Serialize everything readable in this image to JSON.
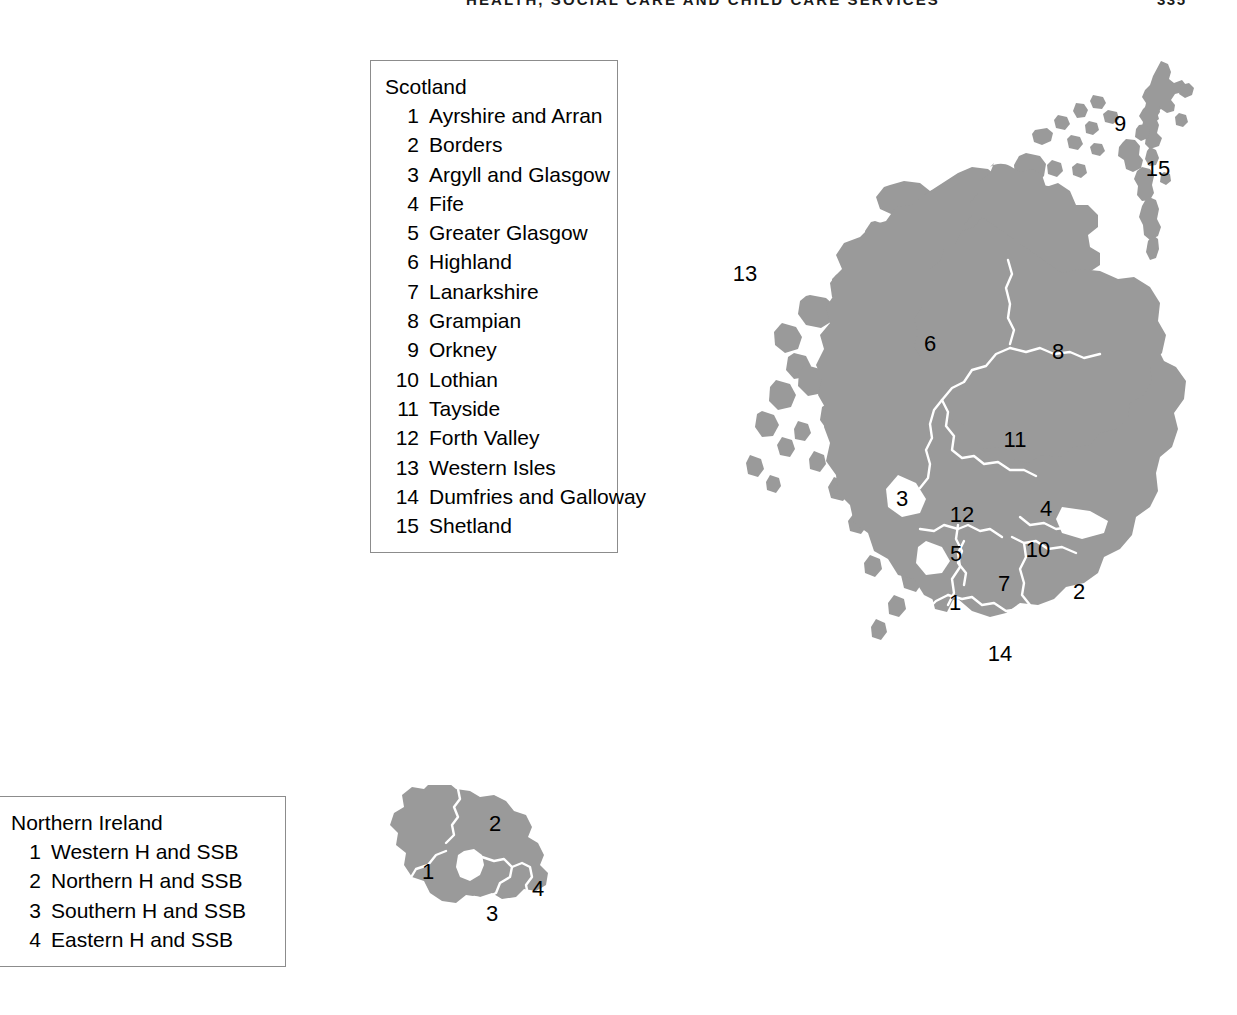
{
  "header": {
    "title": "HEALTH, SOCIAL CARE AND CHILD CARE SERVICES",
    "page_number": "335"
  },
  "legends": {
    "scotland": {
      "title": "Scotland",
      "items": [
        {
          "num": "1",
          "label": "Ayrshire and Arran"
        },
        {
          "num": "2",
          "label": "Borders"
        },
        {
          "num": "3",
          "label": "Argyll and Glasgow"
        },
        {
          "num": "4",
          "label": "Fife"
        },
        {
          "num": "5",
          "label": "Greater Glasgow"
        },
        {
          "num": "6",
          "label": "Highland"
        },
        {
          "num": "7",
          "label": "Lanarkshire"
        },
        {
          "num": "8",
          "label": "Grampian"
        },
        {
          "num": "9",
          "label": "Orkney"
        },
        {
          "num": "10",
          "label": "Lothian"
        },
        {
          "num": "11",
          "label": "Tayside"
        },
        {
          "num": "12",
          "label": "Forth Valley"
        },
        {
          "num": "13",
          "label": "Western Isles"
        },
        {
          "num": "14",
          "label": "Dumfries and Galloway"
        },
        {
          "num": "15",
          "label": "Shetland"
        }
      ]
    },
    "northern_ireland": {
      "title": "Northern Ireland",
      "items": [
        {
          "num": "1",
          "label": "Western H and SSB"
        },
        {
          "num": "2",
          "label": "Northern H and SSB"
        },
        {
          "num": "3",
          "label": "Southern H and SSB"
        },
        {
          "num": "4",
          "label": "Eastern H and SSB"
        }
      ]
    }
  },
  "maps": {
    "scotland": {
      "name": "Scotland health board areas",
      "labels": [
        {
          "num": "13",
          "x": 55,
          "y": 220
        },
        {
          "num": "9",
          "x": 430,
          "y": 70
        },
        {
          "num": "15",
          "x": 468,
          "y": 115
        },
        {
          "num": "6",
          "x": 240,
          "y": 290
        },
        {
          "num": "8",
          "x": 368,
          "y": 298
        },
        {
          "num": "11",
          "x": 325,
          "y": 386
        },
        {
          "num": "3",
          "x": 212,
          "y": 445
        },
        {
          "num": "12",
          "x": 272,
          "y": 461
        },
        {
          "num": "4",
          "x": 356,
          "y": 455
        },
        {
          "num": "5",
          "x": 266,
          "y": 500
        },
        {
          "num": "10",
          "x": 348,
          "y": 496
        },
        {
          "num": "7",
          "x": 314,
          "y": 530
        },
        {
          "num": "2",
          "x": 389,
          "y": 538
        },
        {
          "num": "1",
          "x": 265,
          "y": 549
        },
        {
          "num": "14",
          "x": 310,
          "y": 600
        }
      ]
    },
    "northern_ireland": {
      "name": "Northern Ireland health and social services board areas",
      "labels": [
        {
          "num": "1",
          "x": 68,
          "y": 88
        },
        {
          "num": "2",
          "x": 135,
          "y": 40
        },
        {
          "num": "3",
          "x": 132,
          "y": 130
        },
        {
          "num": "4",
          "x": 178,
          "y": 105
        }
      ]
    }
  },
  "colors": {
    "land_fill": "#9a9a9a",
    "boundary_stroke": "#ffffff",
    "legend_border": "#8c8c8c",
    "legend_shadow": "#000000",
    "background": "#ffffff",
    "text": "#000000"
  }
}
